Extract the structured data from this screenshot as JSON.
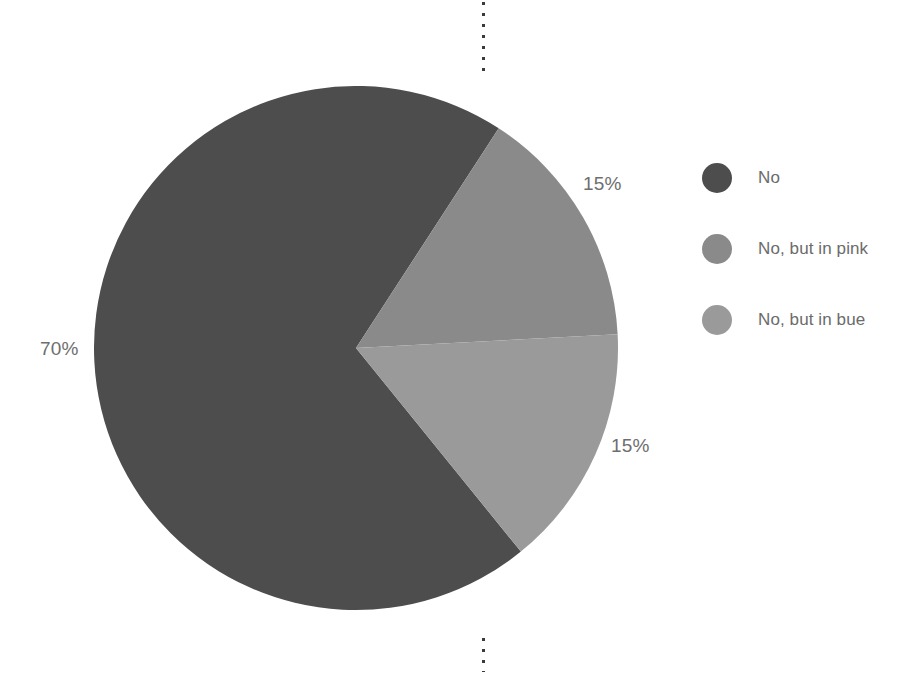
{
  "chart_data": {
    "type": "pie",
    "title": "",
    "labels": [
      "No",
      "No, but in pink",
      "No, but in bue"
    ],
    "values": [
      70,
      15,
      15
    ],
    "value_labels": [
      "70%",
      "15%",
      "15%"
    ],
    "colors": [
      "#4d4d4d",
      "#8a8a8a",
      "#9a9a9a"
    ],
    "legend_position": "right",
    "start_angle_deg": 141,
    "direction": "clockwise",
    "grid": false,
    "units": "percent"
  },
  "callouts": {
    "left": "70%",
    "upper_right": "15%",
    "lower_right": "15%"
  },
  "legend": {
    "items": [
      {
        "label": "No",
        "color": "#4d4d4d"
      },
      {
        "label": "No, but in pink",
        "color": "#8a8a8a"
      },
      {
        "label": "No, but in bue",
        "color": "#9a9a9a"
      }
    ]
  },
  "decorations": {
    "top_mark": "dotted-vertical-rule",
    "bottom_mark": "dotted-vertical-rule"
  }
}
